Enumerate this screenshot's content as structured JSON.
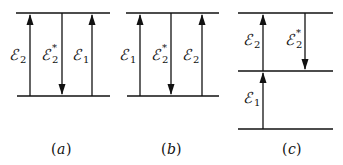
{
  "diagrams": [
    {
      "id": "a",
      "caption": "a",
      "levels": [
        "upper",
        "lower"
      ],
      "transitions": [
        {
          "label": "ℰ",
          "sub": "2",
          "sup": "",
          "direction": "up"
        },
        {
          "label": "ℰ",
          "sub": "2",
          "sup": "*",
          "direction": "down"
        },
        {
          "label": "ℰ",
          "sub": "1",
          "sup": "",
          "direction": "up"
        }
      ]
    },
    {
      "id": "b",
      "caption": "b",
      "levels": [
        "upper",
        "lower"
      ],
      "transitions": [
        {
          "label": "ℰ",
          "sub": "1",
          "sup": "",
          "direction": "up"
        },
        {
          "label": "ℰ",
          "sub": "2",
          "sup": "*",
          "direction": "down"
        },
        {
          "label": "ℰ",
          "sub": "2",
          "sup": "",
          "direction": "up"
        }
      ]
    },
    {
      "id": "c",
      "caption": "c",
      "levels": [
        "top",
        "middle",
        "bottom"
      ],
      "transitions": [
        {
          "label": "ℰ",
          "sub": "2",
          "sup": "",
          "direction": "up",
          "from": "middle",
          "to": "top"
        },
        {
          "label": "ℰ",
          "sub": "2",
          "sup": "*",
          "direction": "down",
          "from": "top",
          "to": "middle"
        },
        {
          "label": "ℰ",
          "sub": "1",
          "sup": "",
          "direction": "up",
          "from": "bottom",
          "to": "middle"
        }
      ]
    }
  ],
  "paren_open": "(",
  "paren_close": ")"
}
